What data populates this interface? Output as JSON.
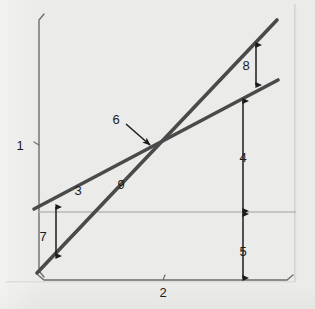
{
  "figure": {
    "type": "technical-line-diagram",
    "background_color": "#ebebe9",
    "line_color": "#4a4a4a",
    "reference_line_color": "#b9b9b7",
    "arrow_color": "#1c1c1c",
    "axis_color": "#6e6e6e",
    "label_color": "#1c1c1c"
  },
  "axes": {
    "y_axis": {
      "label": "1",
      "label_x": 20,
      "label_y": 145,
      "bracket_x": 39,
      "bracket_top": 14,
      "bracket_bottom": 277,
      "tick_y": 145
    },
    "x_axis": {
      "label": "2",
      "label_x": 163,
      "label_y": 292,
      "bracket_y": 280,
      "bracket_left": 38,
      "bracket_right": 293,
      "tick_x": 163
    }
  },
  "lines": [
    {
      "name": "shallow-line",
      "label": "3",
      "label_x": 78,
      "label_y": 190,
      "x1": 34,
      "y1": 209,
      "x2": 278,
      "y2": 80
    },
    {
      "name": "steep-line",
      "label": "9",
      "label_x": 121,
      "label_y": 184,
      "x1": 37,
      "y1": 273,
      "x2": 277,
      "y2": 20
    },
    {
      "name": "horizontal-reference-line",
      "label": "",
      "x1": 39,
      "y1": 212,
      "x2": 296,
      "y2": 212
    }
  ],
  "intersection": {
    "label": "6",
    "label_x": 116,
    "label_y": 119,
    "point_x": 153,
    "point_y": 148,
    "leader_x1": 126,
    "leader_y1": 124,
    "leader_x2": 150,
    "leader_y2": 145
  },
  "dimensions": [
    {
      "name": "dimension-7",
      "label": "7",
      "label_x": 43,
      "label_y": 236,
      "x": 56,
      "y_top": 207,
      "y_bottom": 256,
      "double_headed": true
    },
    {
      "name": "dimension-8",
      "label": "8",
      "label_x": 246,
      "label_y": 65,
      "x": 256,
      "y_top": 45,
      "y_bottom": 85,
      "double_headed": true
    },
    {
      "name": "dimension-4",
      "label": "4",
      "label_x": 243,
      "label_y": 157,
      "x": 243,
      "y_top": 101,
      "y_bottom": 211,
      "double_headed": true
    },
    {
      "name": "dimension-5",
      "label": "5",
      "label_x": 243,
      "label_y": 251,
      "x": 243,
      "y_top": 214,
      "y_bottom": 278,
      "double_headed": true
    }
  ]
}
